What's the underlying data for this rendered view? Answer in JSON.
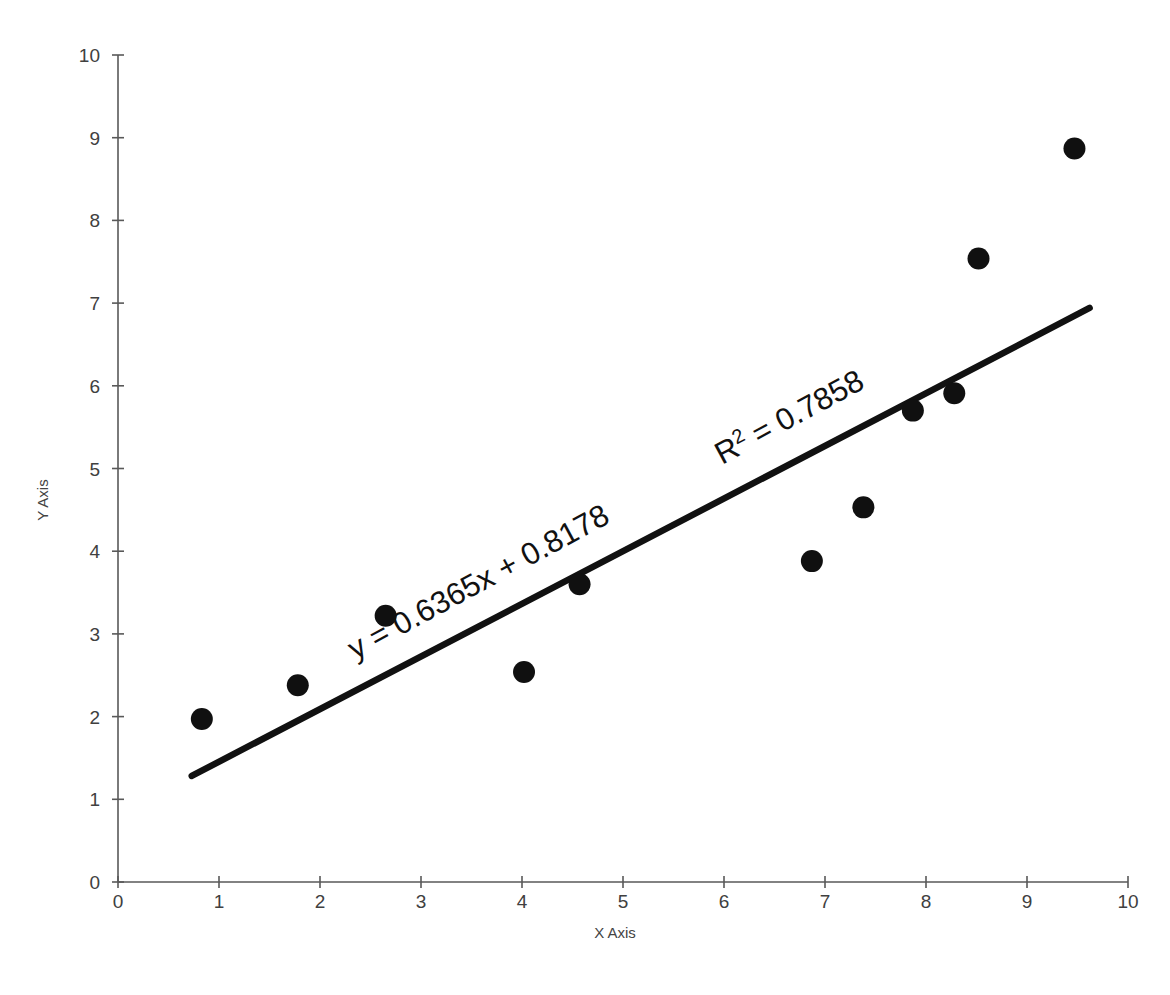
{
  "chart_data": {
    "type": "scatter",
    "title": "",
    "xlabel": "X Axis",
    "ylabel": "Y Axis",
    "xlim": [
      0,
      10
    ],
    "ylim": [
      0,
      10
    ],
    "x_ticks": [
      "0",
      "1",
      "2",
      "3",
      "4",
      "5",
      "6",
      "7",
      "8",
      "9",
      "10"
    ],
    "y_ticks": [
      "0",
      "1",
      "2",
      "3",
      "4",
      "5",
      "6",
      "7",
      "8",
      "9",
      "10"
    ],
    "grid": false,
    "legend": "none",
    "marker_color": "#101010",
    "marker_size_px": 22,
    "trendline_color": "#111111",
    "points": [
      {
        "x": 0.83,
        "y": 1.97
      },
      {
        "x": 1.78,
        "y": 2.38
      },
      {
        "x": 2.65,
        "y": 3.22
      },
      {
        "x": 4.02,
        "y": 2.54
      },
      {
        "x": 4.57,
        "y": 3.6
      },
      {
        "x": 6.87,
        "y": 3.88
      },
      {
        "x": 7.38,
        "y": 4.53
      },
      {
        "x": 7.87,
        "y": 5.7
      },
      {
        "x": 8.28,
        "y": 5.91
      },
      {
        "x": 8.52,
        "y": 7.54
      },
      {
        "x": 9.47,
        "y": 8.87
      }
    ],
    "trendline": {
      "slope": 0.6365,
      "intercept": 0.8178,
      "x_start": 0.73,
      "x_end": 9.62
    },
    "annotations": {
      "equation": "y = 0.6365x + 0.8178",
      "r_squared_prefix": "R",
      "r_squared_exponent": "2",
      "r_squared_value": " = 0.7858"
    }
  }
}
